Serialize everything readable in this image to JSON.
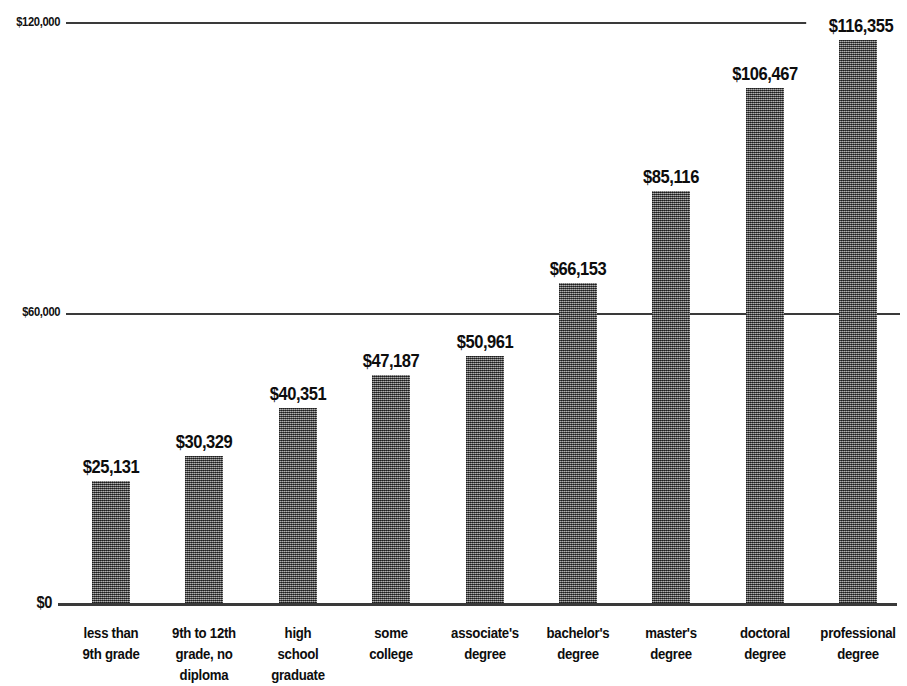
{
  "chart_data": {
    "type": "bar",
    "title": "",
    "subtitle": "",
    "xlabel": "",
    "ylabel": "",
    "ylim": [
      0,
      120000
    ],
    "grid": true,
    "legend": false,
    "legend_position": "none",
    "orientation": "vertical",
    "bar_color": "#6d6d6d",
    "axis_color": "#3a3a3a",
    "categories": [
      "less than 9th grade",
      "9th to 12th grade, no diploma",
      "high school graduate",
      "some college",
      "associate's degree",
      "bachelor's degree",
      "master's degree",
      "doctoral degree",
      "professional degree"
    ],
    "category_lines": [
      [
        "less than",
        "9th grade"
      ],
      [
        "9th to 12th",
        "grade, no",
        "diploma"
      ],
      [
        "high",
        "school",
        "graduate"
      ],
      [
        "some",
        "college"
      ],
      [
        "associate's",
        "degree"
      ],
      [
        "bachelor's",
        "degree"
      ],
      [
        "master's",
        "degree"
      ],
      [
        "doctoral",
        "degree"
      ],
      [
        "professional",
        "degree"
      ]
    ],
    "values": [
      25131,
      30329,
      40351,
      47187,
      50961,
      66153,
      85116,
      106467,
      116355
    ],
    "value_labels": [
      "$25,131",
      "$30,329",
      "$40,351",
      "$47,187",
      "$50,961",
      "$66,153",
      "$85,116",
      "$106,467",
      "$116,355"
    ],
    "yticks": [
      0,
      60000,
      120000
    ],
    "ytick_labels": [
      "$0",
      "$60,000",
      "$120,000"
    ]
  }
}
